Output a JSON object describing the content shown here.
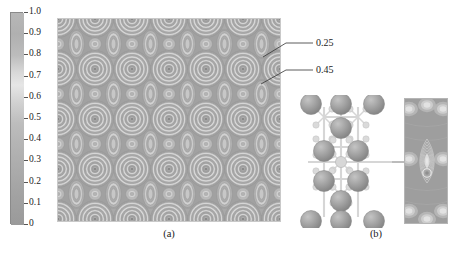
{
  "figure": {
    "type": "scientific-figure",
    "background_color": "#ffffff"
  },
  "colorbar": {
    "orientation": "vertical",
    "colormap": "grayscale",
    "min": 0,
    "max": 1.0,
    "top_color": "#b9b9b9",
    "mid_color": "#e2e2e2",
    "bottom_color": "#9a9a9a",
    "ticks": [
      {
        "value": 1.0,
        "label": "1.0"
      },
      {
        "value": 0.9,
        "label": "0.9"
      },
      {
        "value": 0.8,
        "label": "0.8"
      },
      {
        "value": 0.7,
        "label": "0.7"
      },
      {
        "value": 0.6,
        "label": "0.6"
      },
      {
        "value": 0.5,
        "label": "0.5"
      },
      {
        "value": 0.4,
        "label": "0.4"
      },
      {
        "value": 0.3,
        "label": "0.3"
      },
      {
        "value": 0.2,
        "label": "0.2"
      },
      {
        "value": 0.1,
        "label": "0.1"
      },
      {
        "value": 0.0,
        "label": "0"
      }
    ]
  },
  "panels": {
    "a": {
      "caption": "(a)",
      "kind": "contour-map",
      "lattice_cols": 6,
      "lattice_rows": 4,
      "annotations": [
        {
          "label": "0.25",
          "target": "outer-ring-of-atom"
        },
        {
          "label": "0.45",
          "target": "interstitial-oval"
        }
      ]
    },
    "b": {
      "caption": "(b)",
      "kind": "crystal-structure-with-density-strip",
      "atom_color": "#9b9b9b",
      "bond_color": "#d6d6d6"
    }
  },
  "chart_data": {
    "type": "heatmap",
    "title": "",
    "xlabel": "",
    "ylabel": "",
    "subplots": [
      {
        "id": "a",
        "label": "(a)",
        "type": "contour",
        "colormap": "gray",
        "zlim": [
          0,
          1.0
        ],
        "contour_levels": [
          0.05,
          0.15,
          0.25,
          0.35,
          0.45,
          0.55,
          0.65,
          0.75,
          0.85,
          0.95
        ],
        "labeled_levels": [
          0.25,
          0.45
        ],
        "lattice": {
          "nx": 6,
          "ny": 4,
          "period_x_px": 37,
          "period_y_px": 50,
          "site_types": [
            "large-atom",
            "interstitial-oval",
            "small-site"
          ]
        }
      },
      {
        "id": "b",
        "label": "(b)",
        "type": "contour",
        "colormap": "gray",
        "zlim": [
          0,
          1.0
        ],
        "contour_levels": [
          0.1,
          0.2,
          0.3,
          0.4,
          0.5,
          0.6,
          0.7,
          0.8,
          0.9
        ],
        "structure": {
          "atom_rows": 5,
          "atoms_per_row": [
            3,
            1,
            2,
            2,
            1,
            3
          ],
          "bond_network": "orthorhombic-cage"
        }
      }
    ]
  }
}
